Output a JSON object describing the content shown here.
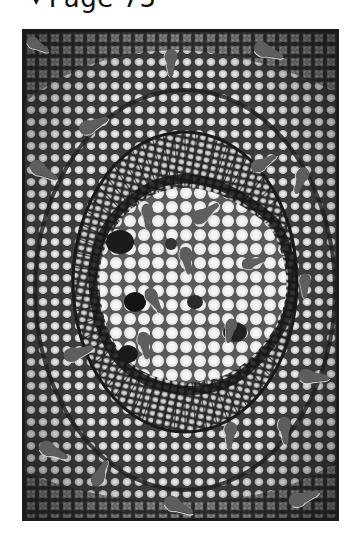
{
  "header": {
    "arrow_icon": "triangle-down-icon",
    "arrow": "▼",
    "title": "Page 75"
  },
  "figure": {
    "frame_color": "#1a1a1a",
    "blob_color": "#5e5e5e",
    "blob_outline_color": "#d8d8d8",
    "blobs": [
      {
        "x": 14,
        "y": 14,
        "rot": 30,
        "s": 0.8
      },
      {
        "x": 146,
        "y": 32,
        "rot": 90,
        "s": 0.9
      },
      {
        "x": 245,
        "y": 20,
        "rot": 20,
        "s": 1.0
      },
      {
        "x": 70,
        "y": 92,
        "rot": -25,
        "s": 1.0
      },
      {
        "x": 182,
        "y": 180,
        "rot": -35,
        "s": 1.0
      },
      {
        "x": 275,
        "y": 150,
        "rot": 110,
        "s": 0.9
      },
      {
        "x": 240,
        "y": 130,
        "rot": -30,
        "s": 0.9
      },
      {
        "x": 20,
        "y": 140,
        "rot": 30,
        "s": 1.0
      },
      {
        "x": 122,
        "y": 185,
        "rot": 90,
        "s": 0.8
      },
      {
        "x": 162,
        "y": 230,
        "rot": 80,
        "s": 0.9
      },
      {
        "x": 230,
        "y": 230,
        "rot": -15,
        "s": 0.8
      },
      {
        "x": 280,
        "y": 255,
        "rot": 90,
        "s": 0.8
      },
      {
        "x": 130,
        "y": 270,
        "rot": 60,
        "s": 0.9
      },
      {
        "x": 205,
        "y": 300,
        "rot": 100,
        "s": 0.8
      },
      {
        "x": 55,
        "y": 320,
        "rot": -20,
        "s": 1.0
      },
      {
        "x": 290,
        "y": 345,
        "rot": 5,
        "s": 1.0
      },
      {
        "x": 120,
        "y": 315,
        "rot": 80,
        "s": 0.9
      },
      {
        "x": 30,
        "y": 420,
        "rot": 25,
        "s": 1.0
      },
      {
        "x": 76,
        "y": 440,
        "rot": -65,
        "s": 0.9
      },
      {
        "x": 205,
        "y": 405,
        "rot": 95,
        "s": 0.9
      },
      {
        "x": 260,
        "y": 400,
        "rot": 85,
        "s": 0.9
      },
      {
        "x": 155,
        "y": 475,
        "rot": 25,
        "s": 1.0
      },
      {
        "x": 280,
        "y": 465,
        "rot": -20,
        "s": 1.0
      }
    ]
  }
}
